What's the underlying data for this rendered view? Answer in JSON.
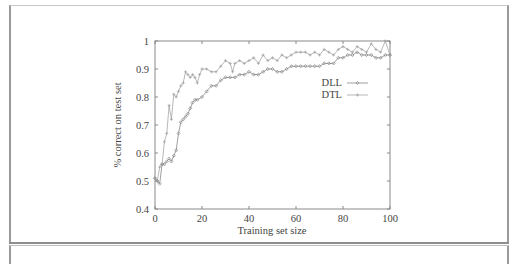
{
  "chart_data": {
    "type": "line",
    "title": "",
    "xlabel": "Training set size",
    "ylabel": "% correct on test set",
    "xlim": [
      0,
      100
    ],
    "ylim": [
      0.4,
      1.0
    ],
    "x_ticks": [
      "0",
      "20",
      "40",
      "60",
      "80",
      "100"
    ],
    "y_ticks": [
      "0.4",
      "0.5",
      "0.6",
      "0.7",
      "0.8",
      "0.9",
      "1"
    ],
    "grid": false,
    "legend_position": "upper-right-inside",
    "series": [
      {
        "name": "DLL",
        "marker": "diamond",
        "color": "#777777",
        "x": [
          0,
          1,
          2,
          3,
          4,
          5,
          6,
          7,
          8,
          9,
          10,
          11,
          12,
          13,
          14,
          15,
          16,
          17,
          18,
          20,
          22,
          24,
          26,
          28,
          30,
          32,
          34,
          36,
          38,
          40,
          42,
          44,
          46,
          48,
          50,
          52,
          54,
          56,
          58,
          60,
          62,
          64,
          66,
          68,
          70,
          72,
          74,
          76,
          78,
          80,
          82,
          84,
          86,
          88,
          90,
          92,
          94,
          96,
          98,
          100
        ],
        "values": [
          0.51,
          0.5,
          0.49,
          0.56,
          0.56,
          0.57,
          0.58,
          0.57,
          0.59,
          0.61,
          0.67,
          0.71,
          0.72,
          0.73,
          0.74,
          0.76,
          0.78,
          0.79,
          0.79,
          0.8,
          0.82,
          0.84,
          0.84,
          0.86,
          0.87,
          0.87,
          0.87,
          0.88,
          0.88,
          0.89,
          0.88,
          0.88,
          0.89,
          0.9,
          0.9,
          0.89,
          0.89,
          0.9,
          0.91,
          0.91,
          0.91,
          0.91,
          0.91,
          0.91,
          0.91,
          0.92,
          0.92,
          0.92,
          0.94,
          0.94,
          0.95,
          0.95,
          0.96,
          0.95,
          0.95,
          0.95,
          0.94,
          0.94,
          0.95,
          0.95
        ]
      },
      {
        "name": "DTL",
        "marker": "plus",
        "color": "#999999",
        "x": [
          0,
          1,
          2,
          3,
          4,
          5,
          6,
          7,
          8,
          9,
          10,
          11,
          12,
          13,
          14,
          15,
          16,
          17,
          18,
          19,
          20,
          22,
          24,
          26,
          28,
          30,
          32,
          33,
          34,
          36,
          38,
          40,
          42,
          44,
          46,
          48,
          50,
          52,
          54,
          56,
          58,
          60,
          62,
          64,
          66,
          68,
          70,
          72,
          74,
          76,
          78,
          80,
          82,
          84,
          86,
          88,
          90,
          92,
          94,
          96,
          98,
          100
        ],
        "values": [
          0.51,
          0.5,
          0.55,
          0.56,
          0.64,
          0.67,
          0.77,
          0.72,
          0.81,
          0.8,
          0.82,
          0.84,
          0.85,
          0.89,
          0.88,
          0.87,
          0.88,
          0.87,
          0.85,
          0.88,
          0.9,
          0.9,
          0.89,
          0.89,
          0.91,
          0.93,
          0.92,
          0.89,
          0.92,
          0.93,
          0.92,
          0.93,
          0.94,
          0.92,
          0.95,
          0.93,
          0.94,
          0.93,
          0.95,
          0.94,
          0.95,
          0.96,
          0.96,
          0.96,
          0.95,
          0.96,
          0.95,
          0.97,
          0.96,
          0.95,
          0.97,
          0.98,
          0.97,
          0.96,
          0.98,
          0.97,
          0.96,
          0.99,
          0.97,
          0.96,
          1.0,
          0.95
        ]
      }
    ]
  },
  "legend": {
    "items": [
      {
        "label": "DLL"
      },
      {
        "label": "DTL"
      }
    ]
  },
  "axes": {
    "xlabel": "Training set size",
    "ylabel": "% correct on test set"
  }
}
